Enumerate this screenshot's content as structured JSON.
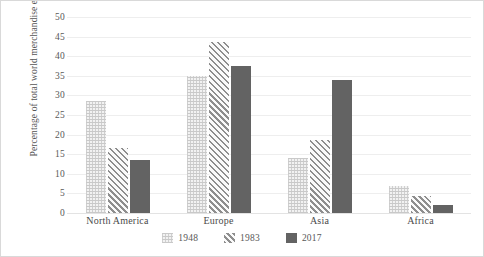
{
  "chart_data": {
    "type": "bar",
    "title": "",
    "xlabel": "",
    "ylabel": "Percentage of total world merchandise exports",
    "ylim": [
      0,
      50
    ],
    "ytick_step": 5,
    "yticks": [
      "50",
      "45",
      "40",
      "35",
      "30",
      "25",
      "20",
      "15",
      "10",
      "5",
      "0"
    ],
    "grid": true,
    "legend_position": "bottom",
    "categories": [
      "North America",
      "Europe",
      "Asia",
      "Africa"
    ],
    "series": [
      {
        "name": "1948",
        "values": [
          28.5,
          35.0,
          14.0,
          7.0
        ],
        "pattern": "fine-crosshatch",
        "color": "#f2f2f2"
      },
      {
        "name": "1983",
        "values": [
          16.5,
          43.5,
          18.7,
          4.3
        ],
        "pattern": "diagonal-hatch",
        "color": "#8e8e8e"
      },
      {
        "name": "2017",
        "values": [
          13.6,
          37.5,
          34.0,
          2.0
        ],
        "pattern": "solid",
        "color": "#636363"
      }
    ]
  }
}
